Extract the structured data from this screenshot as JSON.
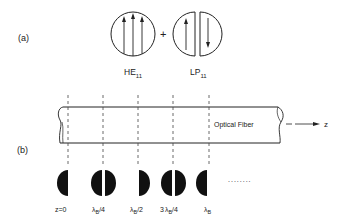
{
  "part_a": {
    "label": "(a)",
    "plus": "+",
    "mode1": {
      "name": "HE",
      "subscript": "11",
      "arrows": [
        "up",
        "up",
        "up"
      ]
    },
    "mode2": {
      "name": "LP",
      "subscript": "11",
      "arrows": [
        "up",
        "down"
      ]
    }
  },
  "part_b": {
    "label": "(b)",
    "fiber_label": "Optical Fiber",
    "axis_label": "z",
    "ellipsis": "........",
    "positions": [
      {
        "label": "z=0",
        "pattern": "left-half"
      },
      {
        "label_main": "λ",
        "label_sub": "B",
        "label_suffix": "/4",
        "pattern": "both-halves"
      },
      {
        "label_main": "λ",
        "label_sub": "B",
        "label_suffix": "/2",
        "pattern": "right-half"
      },
      {
        "label_prefix": "3",
        "label_main": "λ",
        "label_sub": "B",
        "label_suffix": "/4",
        "pattern": "both-halves"
      },
      {
        "label_main": "λ",
        "label_sub": "B",
        "pattern": "left-half"
      }
    ]
  },
  "colors": {
    "ink": "#222222",
    "background": "#ffffff"
  }
}
